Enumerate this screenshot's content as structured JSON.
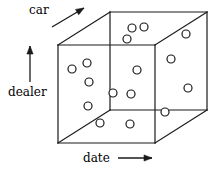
{
  "figure": {
    "kind": "data-cube-diagram",
    "title": "",
    "width": 221,
    "height": 174,
    "background_color": "#ffffff",
    "line_color": "#1a1a1a",
    "marker_color": "#1a1a1a",
    "marker_fill": "#ffffff"
  },
  "axes": [
    {
      "id": "car",
      "label": "car",
      "direction": "up-right",
      "arrow_glyph": "↗",
      "label_x": 29,
      "label_y": 4,
      "arrow": {
        "x1": 52,
        "y1": 27,
        "x2": 84,
        "y2": 8
      }
    },
    {
      "id": "dealer",
      "label": "dealer",
      "direction": "up",
      "arrow_glyph": "↑",
      "label_x": 8,
      "label_y": 86,
      "arrow": {
        "x1": 30,
        "y1": 82,
        "x2": 30,
        "y2": 46
      }
    },
    {
      "id": "date",
      "label": "date",
      "direction": "right",
      "arrow_glyph": "→",
      "label_x": 83,
      "label_y": 152,
      "arrow": {
        "x1": 118,
        "y1": 158,
        "x2": 152,
        "y2": 158
      }
    }
  ],
  "cube": {
    "front_face": {
      "x": 58,
      "y": 45,
      "width": 97,
      "height": 98
    },
    "depth_offset": {
      "dx": 52,
      "dy": -33
    },
    "vertices": {
      "front_top_left": {
        "x": 58,
        "y": 45
      },
      "front_top_right": {
        "x": 155,
        "y": 45
      },
      "front_bottom_left": {
        "x": 58,
        "y": 143
      },
      "front_bottom_right": {
        "x": 155,
        "y": 143
      },
      "back_top_left": {
        "x": 110,
        "y": 12
      },
      "back_top_right": {
        "x": 207,
        "y": 12
      },
      "back_bottom_left": {
        "x": 110,
        "y": 110
      },
      "back_bottom_right": {
        "x": 207,
        "y": 110
      }
    },
    "edges": [
      {
        "name": "front-top",
        "from": "front_top_left",
        "to": "front_top_right",
        "style": "solid"
      },
      {
        "name": "front-right",
        "from": "front_top_right",
        "to": "front_bottom_right",
        "style": "solid"
      },
      {
        "name": "front-bottom",
        "from": "front_bottom_right",
        "to": "front_bottom_left",
        "style": "solid"
      },
      {
        "name": "front-left",
        "from": "front_bottom_left",
        "to": "front_top_left",
        "style": "solid"
      },
      {
        "name": "back-top",
        "from": "back_top_left",
        "to": "back_top_right",
        "style": "solid"
      },
      {
        "name": "back-right",
        "from": "back_top_right",
        "to": "back_bottom_right",
        "style": "solid"
      },
      {
        "name": "back-bottom",
        "from": "back_bottom_right",
        "to": "back_bottom_left",
        "style": "solid"
      },
      {
        "name": "back-left",
        "from": "back_bottom_left",
        "to": "back_top_left",
        "style": "solid"
      },
      {
        "name": "depth-top-left",
        "from": "front_top_left",
        "to": "back_top_left",
        "style": "solid"
      },
      {
        "name": "depth-top-right",
        "from": "front_top_right",
        "to": "back_top_right",
        "style": "solid"
      },
      {
        "name": "depth-bottom-left",
        "from": "front_bottom_left",
        "to": "back_bottom_left",
        "style": "solid"
      },
      {
        "name": "depth-bottom-right",
        "from": "front_bottom_right",
        "to": "back_bottom_right",
        "style": "solid"
      }
    ]
  },
  "data_points": [
    {
      "id": "p1",
      "face": "top",
      "x": 132,
      "y": 28,
      "r": 4
    },
    {
      "id": "p2",
      "face": "top",
      "x": 144,
      "y": 27,
      "r": 4
    },
    {
      "id": "p3",
      "face": "top",
      "x": 127,
      "y": 39,
      "r": 4
    },
    {
      "id": "p4",
      "face": "right",
      "x": 186,
      "y": 34,
      "r": 4
    },
    {
      "id": "p5",
      "face": "right",
      "x": 171,
      "y": 59,
      "r": 4
    },
    {
      "id": "p6",
      "face": "right",
      "x": 188,
      "y": 88,
      "r": 4
    },
    {
      "id": "p7",
      "face": "right",
      "x": 165,
      "y": 112,
      "r": 4
    },
    {
      "id": "p8",
      "face": "left",
      "x": 72,
      "y": 69,
      "r": 4
    },
    {
      "id": "p9",
      "face": "left",
      "x": 87,
      "y": 63,
      "r": 4
    },
    {
      "id": "p10",
      "face": "left",
      "x": 89,
      "y": 82,
      "r": 4
    },
    {
      "id": "p11",
      "face": "left",
      "x": 88,
      "y": 106,
      "r": 4
    },
    {
      "id": "p12",
      "face": "left",
      "x": 100,
      "y": 123,
      "r": 4
    },
    {
      "id": "p13",
      "face": "front",
      "x": 137,
      "y": 70,
      "r": 4
    },
    {
      "id": "p14",
      "face": "front",
      "x": 113,
      "y": 93,
      "r": 4
    },
    {
      "id": "p15",
      "face": "front",
      "x": 131,
      "y": 94,
      "r": 4
    },
    {
      "id": "p16",
      "face": "front",
      "x": 130,
      "y": 124,
      "r": 4
    }
  ],
  "counts": {
    "total_points": 16,
    "top_face": 3,
    "right_face": 4,
    "left_face": 5,
    "front_face": 4
  }
}
